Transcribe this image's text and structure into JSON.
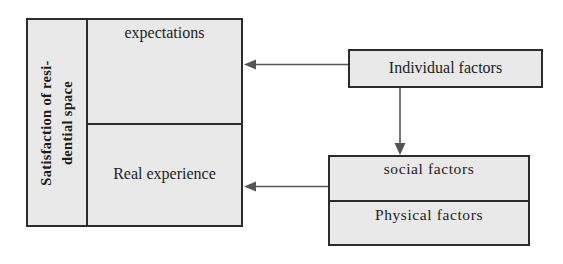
{
  "diagram": {
    "background_color": "#ffffff",
    "box_fill_color": "#e9e9e9",
    "line_color": "#2b2b2b",
    "text_color": "#1d1d1d"
  },
  "satisfaction_box": {
    "side_label_line1": "Satisfaction of resi-",
    "side_label_line2": "dential space",
    "side_label_full": "Satisfaction of residential space",
    "cells": [
      {
        "key": "expectations",
        "label": "expectations"
      },
      {
        "key": "real_experience",
        "label": "Real experience"
      }
    ]
  },
  "individual_factors_box": {
    "label": "Individual factors"
  },
  "factors_box": {
    "rows": [
      {
        "key": "social",
        "label": "social  factors"
      },
      {
        "key": "physical",
        "label": "Physical  factors"
      }
    ]
  },
  "arrows": [
    {
      "name": "individual-to-expectations",
      "from": "Individual factors",
      "to": "expectations",
      "direction": "left"
    },
    {
      "name": "individual-to-social-physical",
      "from": "Individual factors",
      "to": "social factors",
      "direction": "down"
    },
    {
      "name": "social-to-real-experience",
      "from": "social factors",
      "to": "Real experience",
      "direction": "left"
    }
  ]
}
